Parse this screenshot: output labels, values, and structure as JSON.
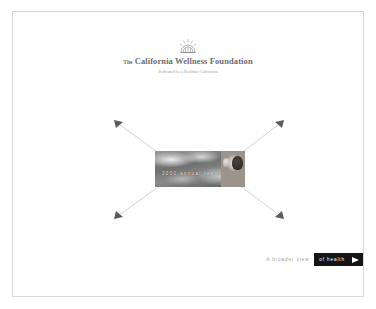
{
  "site": {
    "organization": {
      "article": "The",
      "name": "California Wellness Foundation",
      "tagline": "Dedicated to a Healthier California",
      "logo_icon": "sunburst-emblem-icon"
    }
  },
  "hero": {
    "banner": {
      "caption": "2000 annual report",
      "image_alt": "cloudy sky with portrait of a person",
      "sky_icon": "cloud-photo-icon",
      "portrait_icon": "portrait-photo-icon"
    },
    "rays": [
      {
        "name": "ray-top-left",
        "icon": "arrow-up-left-icon"
      },
      {
        "name": "ray-top-right",
        "icon": "arrow-up-right-icon"
      },
      {
        "name": "ray-bottom-left",
        "icon": "arrow-down-left-icon"
      },
      {
        "name": "ray-bottom-right",
        "icon": "arrow-down-right-icon"
      }
    ]
  },
  "footer_nav": {
    "prefix": "A broader view",
    "button_label": "of health",
    "arrow_icon": "arrow-right-icon"
  },
  "colors": {
    "page_background": "#ffffff",
    "frame_border": "#d8d8d8",
    "wordmark": "#6d6d6d",
    "tagline": "#8f8f8f",
    "nav_prefix": "#9c9c9c",
    "nav_button_background": "#141414",
    "nav_button_text": "#ffffff",
    "ray_line": "#cfcfcf"
  }
}
